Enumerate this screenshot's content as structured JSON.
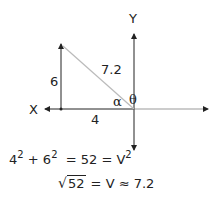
{
  "diagram": {
    "axes": {
      "x_label": "X",
      "y_label": "Y"
    },
    "vector": {
      "vertical_leg_label": "6",
      "horizontal_leg_label": "4",
      "hypotenuse_label": "7.2",
      "angle_alpha": "α",
      "angle_theta": "θ"
    },
    "colors": {
      "axis": "#222222",
      "hypotenuse": "#bbbbbb"
    }
  },
  "formula": {
    "line1": {
      "a": "4",
      "a_exp": "2",
      "plus": "+",
      "b": "6",
      "b_exp": "2",
      "eq1": "=",
      "sum": "52",
      "eq2": "=",
      "v": "V",
      "v_exp": "2"
    },
    "line2": {
      "radicand": "52",
      "rest": " = V ≈ 7.2"
    }
  }
}
